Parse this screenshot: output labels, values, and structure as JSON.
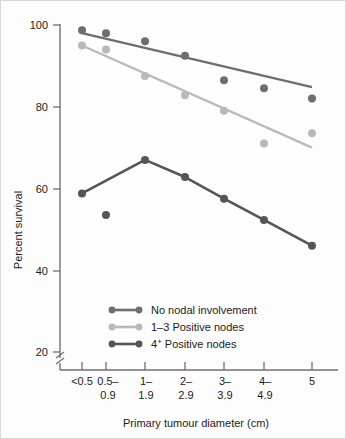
{
  "chart_data": {
    "type": "line",
    "title": "",
    "xlabel": "Primary tumour diameter (cm)",
    "ylabel": "Percent survival",
    "categories": [
      "<0.5",
      "0.5–\n0.9",
      "1–\n1.9",
      "2–\n2.9",
      "3–\n3.9",
      "4–\n4.9",
      "5"
    ],
    "category_lines": [
      [
        "<0.5",
        ""
      ],
      [
        "0.5–",
        "0.9"
      ],
      [
        "1–",
        "1.9"
      ],
      [
        "2–",
        "2.9"
      ],
      [
        "3–",
        "3.9"
      ],
      [
        "4–",
        "4.9"
      ],
      [
        "5",
        ""
      ]
    ],
    "ylim": [
      20,
      100
    ],
    "yticks": [
      100,
      80,
      60,
      40,
      20
    ],
    "ytick_labels": [
      "100",
      "80",
      "60",
      "40",
      "20"
    ],
    "axis_break": true,
    "grid": false,
    "legend_position": "inside-lower-left",
    "series": [
      {
        "name": "No nodal involvement",
        "color": "#6e6e6e",
        "marker_color": "#6e6e6e",
        "values": [
          98.7,
          98.0,
          96.0,
          92.5,
          86.5,
          84.5,
          82.0
        ],
        "trend_start": 98.0,
        "trend_end": 84.8
      },
      {
        "name": "1–3 Positive nodes",
        "color": "#b9b9b9",
        "marker_color": "#b9b9b9",
        "values": [
          95.0,
          94.0,
          87.5,
          82.8,
          79.0,
          71.0,
          73.5
        ],
        "trend_start": 95.0,
        "trend_end": 70.0
      },
      {
        "name": "4⁺ Positive nodes",
        "color": "#555555",
        "marker_color": "#555555",
        "values": [
          58.8,
          53.5,
          67.0,
          62.8,
          57.5,
          52.3,
          46.0
        ],
        "trend_start": 58.8,
        "trend_end": 46.0
      }
    ],
    "legend_entries": [
      {
        "label": "No nodal involvement",
        "color": "#6e6e6e",
        "sup": ""
      },
      {
        "label": "1–3 Positive nodes",
        "color": "#b9b9b9",
        "sup": ""
      },
      {
        "label_prefix": "4",
        "sup": "+",
        "label_suffix": " Positive nodes",
        "label": "4⁺ Positive nodes",
        "color": "#555555"
      }
    ]
  },
  "axis": {
    "y_title": "Percent survival",
    "x_title": "Primary tumour diameter (cm)",
    "axis_color": "#707070"
  }
}
